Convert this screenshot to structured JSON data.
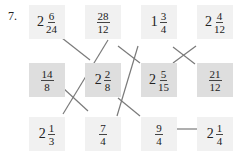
{
  "problem_number": "7.",
  "boxes": [
    {
      "id": "r1c1",
      "whole": "2",
      "num": "6",
      "den": "24",
      "row": 0,
      "col": 0
    },
    {
      "id": "r1c2",
      "whole": "",
      "num": "28",
      "den": "12",
      "row": 0,
      "col": 1
    },
    {
      "id": "r1c3",
      "whole": "1",
      "num": "3",
      "den": "4",
      "row": 0,
      "col": 2
    },
    {
      "id": "r1c4",
      "whole": "2",
      "num": "4",
      "den": "12",
      "row": 0,
      "col": 3
    },
    {
      "id": "r2c1",
      "whole": "",
      "num": "14",
      "den": "8",
      "row": 1,
      "col": 0
    },
    {
      "id": "r2c2",
      "whole": "2",
      "num": "2",
      "den": "8",
      "row": 1,
      "col": 1
    },
    {
      "id": "r2c3",
      "whole": "2",
      "num": "5",
      "den": "15",
      "row": 1,
      "col": 2
    },
    {
      "id": "r2c4",
      "whole": "",
      "num": "21",
      "den": "12",
      "row": 1,
      "col": 3
    },
    {
      "id": "r3c1",
      "whole": "2",
      "num": "1",
      "den": "3",
      "row": 2,
      "col": 0
    },
    {
      "id": "r3c2",
      "whole": "",
      "num": "7",
      "den": "4",
      "row": 2,
      "col": 1
    },
    {
      "id": "r3c3",
      "whole": "",
      "num": "9",
      "den": "4",
      "row": 2,
      "col": 2
    },
    {
      "id": "r3c4",
      "whole": "2",
      "num": "1",
      "den": "4",
      "row": 2,
      "col": 3
    }
  ],
  "b": {
    "w0": "2",
    "n0": "6",
    "d0": "24",
    "n1": "28",
    "d1": "12",
    "w2": "1",
    "n2": "3",
    "d2": "4",
    "w3": "2",
    "n3": "4",
    "d3": "12",
    "n4": "14",
    "d4": "8",
    "w5": "2",
    "n5": "2",
    "d5": "8",
    "w6": "2",
    "n6": "5",
    "d6": "15",
    "n7": "21",
    "d7": "12",
    "w8": "2",
    "n8": "1",
    "d8": "3",
    "n9": "7",
    "d9": "4",
    "n10": "9",
    "d10": "4",
    "w11": "2",
    "n11": "1",
    "d11": "4"
  },
  "connections": [
    [
      "2 6/24",
      "2 2/8"
    ],
    [
      "28/12",
      "2 1/3"
    ],
    [
      "28/12",
      "2 5/15"
    ],
    [
      "1 3/4",
      "7/4"
    ],
    [
      "1 3/4",
      "21/12"
    ],
    [
      "2 4/12",
      "2 5/15"
    ],
    [
      "14/8",
      "7/4"
    ],
    [
      "2 2/8",
      "9/4"
    ],
    [
      "9/4",
      "2 1/4"
    ]
  ],
  "colors": {
    "light_box": "#f1f1f1",
    "dark_box": "#dedede",
    "line": "#777777"
  }
}
